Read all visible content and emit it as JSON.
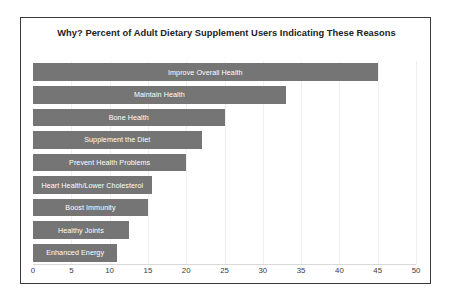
{
  "chart_data": {
    "type": "bar",
    "orientation": "horizontal",
    "title": "Why?  Percent of Adult Dietary Supplement Users Indicating These Reasons",
    "xlabel": "",
    "ylabel": "",
    "xlim": [
      0,
      50
    ],
    "xticks": [
      0,
      5,
      10,
      15,
      20,
      25,
      30,
      35,
      40,
      45,
      50
    ],
    "grid": "vertical-light",
    "legend": "none",
    "bar_color": "#757575",
    "label_color": "#ffffff",
    "categories": [
      "Improve Overall Health",
      "Maintain Health",
      "Bone Health",
      "Supplement the Diet",
      "Prevent Health Problems",
      "Heart Health/Lower Cholesterol",
      "Boost Immunity",
      "Healthy Joints",
      "Enhanced Energy"
    ],
    "values": [
      45,
      33,
      25,
      22,
      20,
      15.5,
      15,
      12.5,
      11
    ]
  },
  "axis": {
    "tick_labels": [
      "0",
      "5",
      "10",
      "15",
      "20",
      "25",
      "30",
      "35",
      "40",
      "45",
      "50"
    ]
  },
  "bars": [
    {
      "label": "Improve Overall Health",
      "value": 45
    },
    {
      "label": "Maintain Health",
      "value": 33
    },
    {
      "label": "Bone Health",
      "value": 25
    },
    {
      "label": "Supplement the Diet",
      "value": 22
    },
    {
      "label": "Prevent Health Problems",
      "value": 20
    },
    {
      "label": "Heart Health/Lower Cholesterol",
      "value": 15.5
    },
    {
      "label": "Boost Immunity",
      "value": 15
    },
    {
      "label": "Healthy Joints",
      "value": 12.5
    },
    {
      "label": "Enhanced Energy",
      "value": 11
    }
  ]
}
